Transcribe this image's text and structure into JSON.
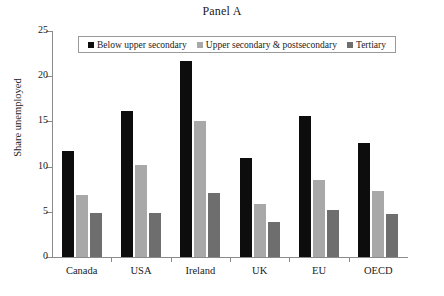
{
  "chart_data": {
    "type": "bar",
    "title": "Panel A",
    "xlabel": "",
    "ylabel": "Share unemployed",
    "ylim": [
      0,
      25
    ],
    "yticks": [
      0,
      5,
      10,
      15,
      20,
      25
    ],
    "grid": false,
    "legend_position": "top-center",
    "categories": [
      "Canada",
      "USA",
      "Ireland",
      "UK",
      "EU",
      "OECD"
    ],
    "series": [
      {
        "name": "Below upper secondary",
        "color": "#0d0d0d",
        "values": [
          11.7,
          16.1,
          21.7,
          11.0,
          15.6,
          12.6
        ]
      },
      {
        "name": "Upper secondary & postsecondary",
        "color": "#a8a8a8",
        "values": [
          6.9,
          10.2,
          15.0,
          5.9,
          8.5,
          7.3
        ]
      },
      {
        "name": "Tertiary",
        "color": "#6e6e6e",
        "values": [
          4.9,
          4.9,
          7.1,
          3.9,
          5.2,
          4.8
        ]
      }
    ]
  },
  "axis": {
    "ytick_labels": [
      "0",
      "5",
      "10",
      "15",
      "20",
      "25"
    ]
  },
  "legend": {
    "items": [
      {
        "label": "Below upper secondary",
        "color": "#0d0d0d"
      },
      {
        "label": "Upper secondary & postsecondary",
        "color": "#a8a8a8"
      },
      {
        "label": "Tertiary",
        "color": "#6e6e6e"
      }
    ]
  }
}
